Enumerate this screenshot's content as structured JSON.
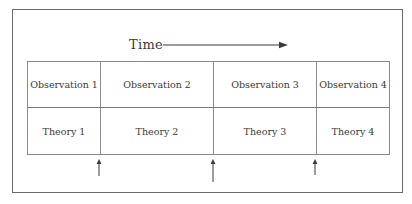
{
  "diagram": {
    "time_axis": {
      "label": "Time",
      "direction": "right-arrow"
    },
    "columns": [
      {
        "observation": "Observation 1",
        "theory": "Theory 1"
      },
      {
        "observation": "Observation 2",
        "theory": "Theory 2"
      },
      {
        "observation": "Observation 3",
        "theory": "Theory 3"
      },
      {
        "observation": "Observation 4",
        "theory": "Theory 4"
      }
    ],
    "transition_markers": [
      {
        "icon": "up-arrow-icon",
        "between": "Theory 1 / Theory 2"
      },
      {
        "icon": "up-arrow-icon",
        "between": "Theory 2 / Theory 3"
      },
      {
        "icon": "up-arrow-icon",
        "between": "Theory 3 / Theory 4"
      }
    ],
    "colors": {
      "line": "#8a8a8a",
      "frame": "#6a6a6a",
      "text": "#3a3a3a",
      "background": "#ffffff"
    }
  }
}
